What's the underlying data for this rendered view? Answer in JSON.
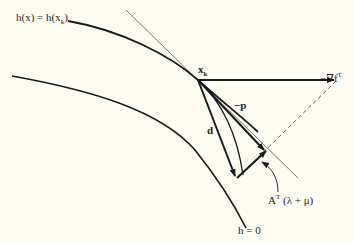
{
  "diagram": {
    "labels": {
      "constraint_curve": "h(x) = h(x",
      "constraint_curve_sub": "k",
      "constraint_curve_end": ")",
      "point": "x",
      "point_sub": "k",
      "gradient": "−∇f",
      "gradient_sup": "T",
      "projected": "−p",
      "direction": "d",
      "multiplier_term": "A",
      "multiplier_sup": "T",
      "multiplier_rest": " (λ + μ)",
      "zero_curve": "h = 0"
    },
    "colors": {
      "background": "#fdfdf3",
      "line": "#1a1a1a"
    }
  }
}
